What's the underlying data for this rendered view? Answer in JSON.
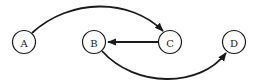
{
  "diagram": {
    "type": "directed-graph",
    "nodes": [
      {
        "id": "A",
        "label": "A",
        "cx": 24,
        "cy": 42
      },
      {
        "id": "B",
        "label": "B",
        "cx": 94,
        "cy": 42
      },
      {
        "id": "C",
        "label": "C",
        "cx": 170,
        "cy": 42
      },
      {
        "id": "D",
        "label": "D",
        "cx": 234,
        "cy": 42
      }
    ],
    "edges": [
      {
        "from": "A",
        "to": "C",
        "style": "curved-above"
      },
      {
        "from": "C",
        "to": "B",
        "style": "straight"
      },
      {
        "from": "B",
        "to": "D",
        "style": "curved-below"
      }
    ],
    "colors": {
      "stroke": "#1a1a1a",
      "fill": "#ffffff"
    }
  }
}
